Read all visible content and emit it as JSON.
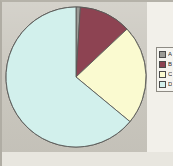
{
  "figure": {
    "background_color": "#c9c6bd",
    "paper_color": "#f2f0ea",
    "border_color": "#8e8b84"
  },
  "legend": {
    "position": "right",
    "clipped": true,
    "entries": [
      {
        "label": "A",
        "color": "#9b9b96"
      },
      {
        "label": "B",
        "color": "#8d4352"
      },
      {
        "label": "C",
        "color": "#fafad0"
      },
      {
        "label": "D",
        "color": "#d2f0ec"
      }
    ]
  },
  "chart_data": {
    "type": "pie",
    "title": "",
    "subtitle": "",
    "xlabel": "",
    "ylabel": "",
    "grid": false,
    "legend_position": "right",
    "start_angle_deg": 0,
    "direction": "clockwise",
    "categories": [
      "A",
      "B",
      "C",
      "D"
    ],
    "values": [
      1,
      12,
      23,
      64
    ],
    "units": "percent",
    "colors": [
      "#9b9b96",
      "#8d4352",
      "#fafad0",
      "#d2f0ec"
    ],
    "slice_edge_color": "#5a5a58",
    "annotations": []
  }
}
